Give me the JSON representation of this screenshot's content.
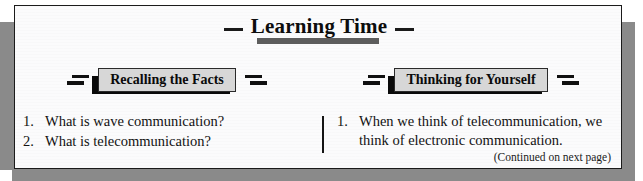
{
  "panel": {
    "title": "Learning Time",
    "title_dash_left": "em-dash",
    "title_dash_right": "em-dash",
    "continued_note": "(Continued on next page)"
  },
  "colors": {
    "title_bar": "#5d5d5d",
    "headbox_fill": "#d7d7d7",
    "headbox_shadow": "#0a0a0a",
    "frame_border": "#1b1b1b",
    "panel_background": "#fbfbfc",
    "outer_shadow": "#8a8a8a",
    "text": "#121212"
  },
  "columns": [
    {
      "heading": "Recalling the Facts",
      "items": [
        {
          "num": "1.",
          "text": "What is wave communication?"
        },
        {
          "num": "2.",
          "text": "What is telecommunication?"
        }
      ]
    },
    {
      "heading": "Thinking for Yourself",
      "items": [
        {
          "num": "1.",
          "text": "When we think of telecommunication, we think of electronic communication."
        }
      ]
    }
  ]
}
